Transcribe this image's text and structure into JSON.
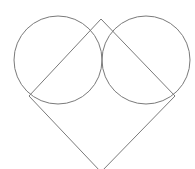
{
  "diagram": {
    "stroke_color": "#7a7a7a",
    "background": "#ffffff",
    "circles": [
      {
        "name": "left-circle",
        "cx": 58,
        "cy": 60,
        "r": 44
      },
      {
        "name": "right-circle",
        "cx": 146,
        "cy": 60,
        "r": 44
      }
    ],
    "square": {
      "name": "rotated-square",
      "points": "101,19 175,96 101,172 29,96"
    }
  }
}
